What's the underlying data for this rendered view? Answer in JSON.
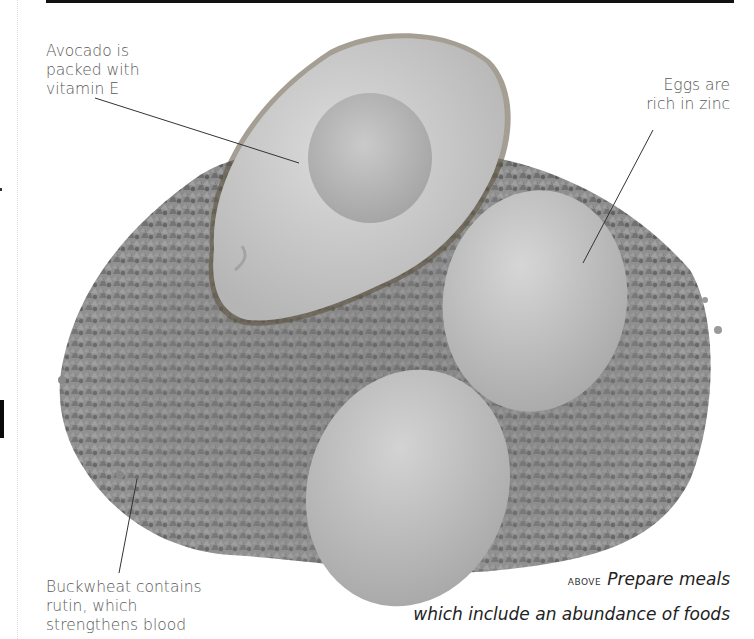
{
  "page": {
    "top_rule_color": "#111111"
  },
  "annotations": {
    "avocado": [
      "Avocado is",
      "packed with",
      "vitamin E"
    ],
    "eggs": [
      "Eggs are",
      "rich in zinc"
    ],
    "buckwheat": [
      "Buckwheat contains",
      "rutin, which",
      "strengthens blood"
    ]
  },
  "caption": {
    "marker": "above",
    "line1": "Prepare meals",
    "line2": "which include an abundance of foods"
  },
  "photo": {
    "subject": "Half avocado, two eggs on a mound of buckwheat grains",
    "palette": {
      "avocado_flesh": "#cfcfcf",
      "avocado_pit_hollow": "#b7b7b7",
      "egg": "#c2c2c2",
      "grain": "#8a8a8a",
      "grain_dark": "#5e5e5e"
    }
  }
}
